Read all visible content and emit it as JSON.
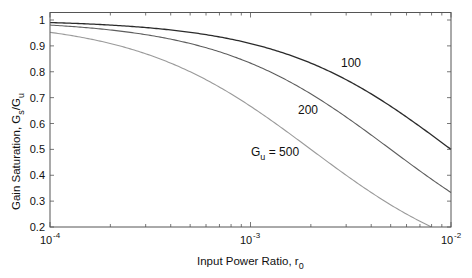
{
  "chart_data": {
    "type": "line",
    "title": "",
    "xlabel": "Input Power Ratio, r0",
    "xlabel_main": "Input Power Ratio, r",
    "xlabel_sub": "0",
    "ylabel": "Gain Saturation, Gs/Gu",
    "ylabel_main": "Gain Saturation, G",
    "ylabel_sub1": "s",
    "ylabel_mid": "/G",
    "ylabel_sub2": "u",
    "xscale": "log",
    "xlim": [
      0.0001,
      0.01
    ],
    "ylim": [
      0.2,
      1.02
    ],
    "xticks": [
      {
        "value": 0.0001,
        "base": "10",
        "exp": "-4"
      },
      {
        "value": 0.001,
        "base": "10",
        "exp": "-3"
      },
      {
        "value": 0.01,
        "base": "10",
        "exp": "-2"
      }
    ],
    "yticks": [
      0.2,
      0.3,
      0.4,
      0.5,
      0.6,
      0.7,
      0.8,
      0.9,
      1
    ],
    "ytick_labels": [
      "0.2",
      "0.3",
      "0.4",
      "0.5",
      "0.6",
      "0.7",
      "0.8",
      "0.9",
      "1"
    ],
    "grid": false,
    "legend": "inline labels",
    "model": "Gs/Gu = 1 / (1 + Gu * r0)",
    "x": [
      0.0001,
      0.0002,
      0.0005,
      0.001,
      0.002,
      0.005,
      0.01
    ],
    "series": [
      {
        "name": "100",
        "label": "100",
        "color": "#2b2b2b",
        "values": [
          0.99,
          0.98,
          0.952,
          0.909,
          0.833,
          0.667,
          0.5
        ],
        "gu": 100
      },
      {
        "name": "200",
        "label": "200",
        "color": "#5e5e5e",
        "values": [
          0.98,
          0.962,
          0.909,
          0.833,
          0.714,
          0.5,
          0.333
        ],
        "gu": 200
      },
      {
        "name": "Gu = 500",
        "label_main": "G",
        "label_sub": "u",
        "label_rest": " = 500",
        "color": "#9a9a9a",
        "values": [
          0.952,
          0.909,
          0.8,
          0.667,
          0.5,
          0.286,
          0.167
        ],
        "gu": 500
      }
    ]
  }
}
